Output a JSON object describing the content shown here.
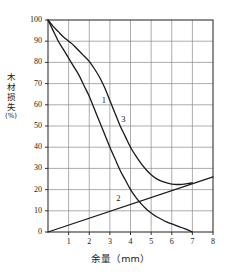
{
  "chart_data": {
    "type": "line",
    "title": "",
    "xlabel": "余量（mm）",
    "ylabel": "木材损失(%)",
    "ylabel_main": "木材损失",
    "ylabel_unit": "(%)",
    "xlim": [
      0,
      8
    ],
    "ylim": [
      0,
      100
    ],
    "xticks": [
      "1",
      "2",
      "3",
      "4",
      "5",
      "6",
      "7",
      "8"
    ],
    "xtick_values": [
      1,
      2,
      3,
      4,
      5,
      6,
      7,
      8
    ],
    "yticks": [
      "0",
      "10",
      "20",
      "30",
      "40",
      "50",
      "60",
      "70",
      "80",
      "90",
      "100"
    ],
    "ytick_values": [
      0,
      10,
      20,
      30,
      40,
      50,
      60,
      70,
      80,
      90,
      100
    ],
    "grid": true,
    "legend_position": "inline-labels",
    "line_color": "#1a1a1a",
    "grid_color": "#8a8a8a",
    "axis_color": "#333333",
    "background": "#ffffff",
    "series": [
      {
        "name": "1",
        "label": "1",
        "label_x": 2.7,
        "label_y": 62,
        "kind": "curve",
        "points": [
          [
            0,
            100
          ],
          [
            0.25,
            95
          ],
          [
            0.5,
            90
          ],
          [
            0.75,
            86
          ],
          [
            1,
            82
          ],
          [
            1.25,
            78
          ],
          [
            1.5,
            74
          ],
          [
            1.75,
            69
          ],
          [
            2,
            64
          ],
          [
            2.25,
            58
          ],
          [
            2.5,
            52
          ],
          [
            2.75,
            46
          ],
          [
            3,
            40
          ],
          [
            3.25,
            34.5
          ],
          [
            3.5,
            29
          ],
          [
            3.75,
            24.5
          ],
          [
            4,
            20
          ],
          [
            4.25,
            16.5
          ],
          [
            4.5,
            13.5
          ],
          [
            4.75,
            11
          ],
          [
            5,
            9
          ],
          [
            5.25,
            7.3
          ],
          [
            5.5,
            6
          ],
          [
            5.75,
            4.8
          ],
          [
            6,
            3.8
          ],
          [
            6.25,
            2.9
          ],
          [
            6.5,
            2
          ],
          [
            6.75,
            1.1
          ],
          [
            7,
            0
          ]
        ]
      },
      {
        "name": "2",
        "label": "2",
        "label_x": 3.4,
        "label_y": 15.5,
        "kind": "line",
        "points": [
          [
            0,
            0
          ],
          [
            8,
            26
          ]
        ]
      },
      {
        "name": "3",
        "label": "3",
        "label_x": 3.65,
        "label_y": 53,
        "kind": "curve",
        "points": [
          [
            0,
            100
          ],
          [
            0.25,
            97
          ],
          [
            0.5,
            94.5
          ],
          [
            0.75,
            92
          ],
          [
            1,
            90
          ],
          [
            1.25,
            88
          ],
          [
            1.5,
            85.5
          ],
          [
            1.75,
            83
          ],
          [
            2,
            80.5
          ],
          [
            2.25,
            77
          ],
          [
            2.5,
            73
          ],
          [
            2.75,
            68
          ],
          [
            3,
            62
          ],
          [
            3.25,
            56
          ],
          [
            3.5,
            50
          ],
          [
            3.75,
            45
          ],
          [
            4,
            40
          ],
          [
            4.25,
            36
          ],
          [
            4.5,
            32.5
          ],
          [
            4.75,
            29.5
          ],
          [
            5,
            27
          ],
          [
            5.25,
            25.2
          ],
          [
            5.5,
            24
          ],
          [
            5.75,
            23.2
          ],
          [
            6,
            22.6
          ],
          [
            6.25,
            22.4
          ],
          [
            6.5,
            22.5
          ],
          [
            6.75,
            22.8
          ],
          [
            7,
            23.2
          ]
        ]
      }
    ]
  },
  "plot_geometry": {
    "left": 48,
    "right": 213,
    "top": 20,
    "bottom": 232
  }
}
